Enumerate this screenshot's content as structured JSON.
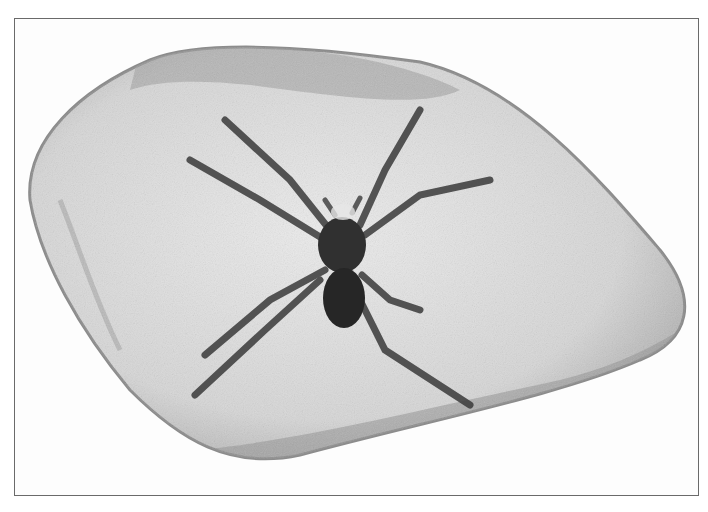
{
  "image": {
    "subject": "spider embedded in amber stone",
    "style": "grayscale photograph with thin border frame",
    "colors": {
      "background": "#ffffff",
      "frame_border": "#6a6a6a",
      "stone_fill": "#dcdcdc",
      "stone_edge": "#8c8c8c",
      "spider": "#2e2e2e"
    }
  }
}
